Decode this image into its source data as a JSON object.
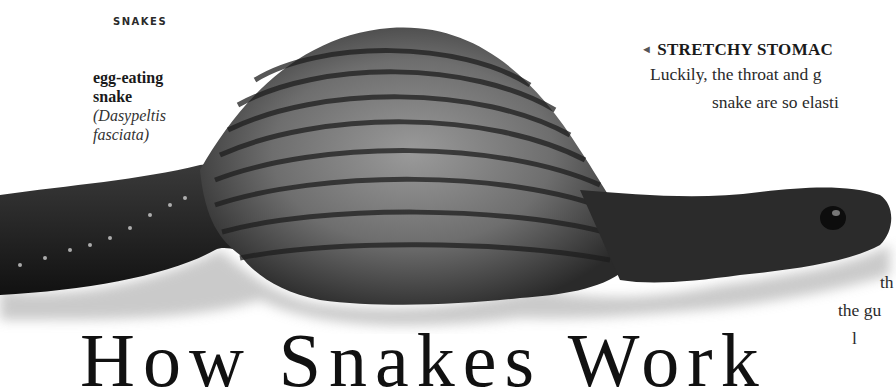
{
  "page": {
    "section_label": "SNAKES",
    "caption": {
      "common_name_line1": "egg-eating",
      "common_name_line2": "snake",
      "latin_line1": "(Dasypeltis",
      "latin_line2": "fasciata)"
    },
    "sidebar": {
      "arrow_icon": "◄",
      "heading": "STRETCHY STOMAC",
      "lines": [
        "Luckily, the throat and g",
        "snake are so elasti",
        "th",
        "the gu",
        "l"
      ]
    },
    "title_partial": "How Snakes Work",
    "image": {
      "subject": "egg-eating snake swallowing an egg, body bulging",
      "colors": {
        "body_dark": "#1c1c1c",
        "body_mid": "#4a4a4a",
        "bulge_light": "#8a8a8a",
        "shadow": "#c8c8c8"
      }
    }
  }
}
